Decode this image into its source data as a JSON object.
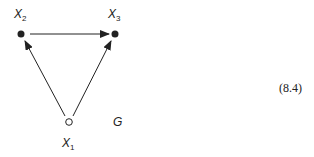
{
  "graph": {
    "name": "G",
    "nodes": [
      {
        "id": "X1",
        "base": "X",
        "sub": "1",
        "filled": false
      },
      {
        "id": "X2",
        "base": "X",
        "sub": "2",
        "filled": true
      },
      {
        "id": "X3",
        "base": "X",
        "sub": "3",
        "filled": true
      }
    ],
    "edges": [
      {
        "from": "X2",
        "to": "X3"
      },
      {
        "from": "X1",
        "to": "X2"
      },
      {
        "from": "X1",
        "to": "X3"
      }
    ]
  },
  "equation_number": "(8.4)",
  "colors": {
    "ink": "#222222"
  }
}
